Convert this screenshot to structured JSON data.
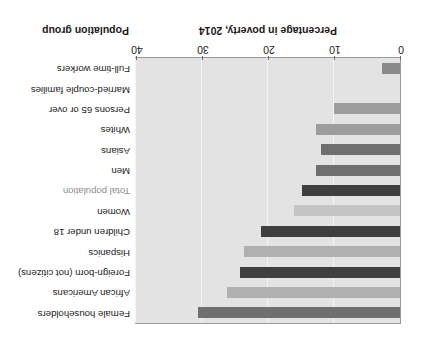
{
  "chart_data": {
    "type": "bar",
    "orientation": "horizontal",
    "title": "",
    "xlabel": "Percentage in poverty, 2014",
    "ylabel": "Population group",
    "xlim": [
      0,
      40
    ],
    "xticks": [
      0,
      10,
      20,
      30,
      40
    ],
    "grid": true,
    "legend": "none",
    "rotated_180": true,
    "categories": [
      "Female householders",
      "African Americans",
      "Foreign-born (not citizens)",
      "Hispanics",
      "Children under 18",
      "Women",
      "Total population",
      "Men",
      "Asians",
      "Whites",
      "Persons 65 or over",
      "Married-couple families",
      "Full-time workers"
    ],
    "values": [
      30.6,
      26.2,
      24.2,
      23.6,
      21.1,
      16.1,
      14.8,
      12.7,
      12.0,
      12.7,
      10.0,
      0.0,
      2.8
    ],
    "bar_colors": [
      "#6f6f6f",
      "#b0b0b0",
      "#3f3f3f",
      "#b0b0b0",
      "#3f3f3f",
      "#c4c4c4",
      "#3f3f3f",
      "#6f6f6f",
      "#6f6f6f",
      "#9d9d9d",
      "#9d9d9d",
      "#9d9d9d",
      "#8a8a8a"
    ],
    "label_muted": [
      false,
      false,
      false,
      false,
      false,
      false,
      true,
      false,
      false,
      false,
      false,
      false,
      false
    ],
    "plot_background": "#e3e3e3",
    "gridline_color": "#f4f4f4",
    "axis_color": "#9a9a9a"
  }
}
